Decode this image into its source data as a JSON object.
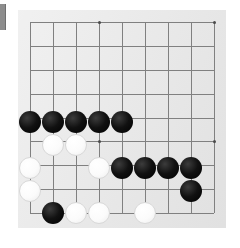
{
  "board": {
    "name": "go-board",
    "kind": "go",
    "background_color": "#e9e9e9",
    "line_color": "#808080",
    "page_background": "#ffffff",
    "columns": 9,
    "rows": 9,
    "cell_size": 23,
    "origin_x": 30,
    "origin_y": 22,
    "star_points": [
      {
        "col": 3,
        "row": 0
      },
      {
        "col": 8,
        "row": 0
      },
      {
        "col": 3,
        "row": 5
      },
      {
        "col": 8,
        "row": 5
      }
    ],
    "grid_lines_x": [
      30,
      53,
      76,
      99,
      122,
      145,
      168,
      191,
      214
    ],
    "grid_lines_y": [
      22,
      45,
      68,
      91,
      114,
      122,
      145,
      168,
      191,
      213
    ]
  },
  "edge_marker": {
    "name": "left-edge-marker",
    "color": "#8d8d8d"
  },
  "stones": [
    {
      "id": "b1",
      "color": "black",
      "x": 30,
      "y": 122
    },
    {
      "id": "b2",
      "color": "black",
      "x": 53,
      "y": 122
    },
    {
      "id": "b3",
      "color": "black",
      "x": 76,
      "y": 122
    },
    {
      "id": "b4",
      "color": "black",
      "x": 99,
      "y": 122
    },
    {
      "id": "b5",
      "color": "black",
      "x": 122,
      "y": 122
    },
    {
      "id": "w1",
      "color": "white",
      "x": 53,
      "y": 145
    },
    {
      "id": "w2",
      "color": "white",
      "x": 76,
      "y": 145
    },
    {
      "id": "w3",
      "color": "white",
      "x": 30,
      "y": 168
    },
    {
      "id": "w4",
      "color": "white",
      "x": 99,
      "y": 168
    },
    {
      "id": "b6",
      "color": "black",
      "x": 122,
      "y": 168
    },
    {
      "id": "b7",
      "color": "black",
      "x": 145,
      "y": 168
    },
    {
      "id": "b8",
      "color": "black",
      "x": 168,
      "y": 168
    },
    {
      "id": "b9",
      "color": "black",
      "x": 191,
      "y": 168
    },
    {
      "id": "w5",
      "color": "white",
      "x": 30,
      "y": 191
    },
    {
      "id": "b10",
      "color": "black",
      "x": 191,
      "y": 191
    },
    {
      "id": "b11",
      "color": "black",
      "x": 53,
      "y": 213
    },
    {
      "id": "w6",
      "color": "white",
      "x": 76,
      "y": 213
    },
    {
      "id": "w7",
      "color": "white",
      "x": 99,
      "y": 213
    },
    {
      "id": "w8",
      "color": "white",
      "x": 145,
      "y": 213
    }
  ],
  "counts": {
    "black_stones": 11,
    "white_stones": 8,
    "total_stones": 19
  }
}
